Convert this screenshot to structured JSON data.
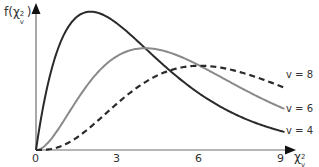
{
  "chart_data": {
    "type": "line",
    "title": "",
    "ylabel": "f(χ²_ν)",
    "xlabel": "χ²_ν",
    "x_ticks": [
      "0",
      "3",
      "6",
      "9"
    ],
    "xlim": [
      0,
      9.3
    ],
    "grid": false,
    "legend_position": "inline-right",
    "series": [
      {
        "name": "ν = 4",
        "label": "v = 4",
        "color": "#2a2a2a",
        "style": "solid",
        "df": 4,
        "x": [
          0,
          1,
          2,
          3,
          4,
          5,
          6,
          7,
          8,
          9
        ],
        "y": [
          0,
          0.152,
          0.184,
          0.167,
          0.135,
          0.103,
          0.075,
          0.053,
          0.037,
          0.025
        ]
      },
      {
        "name": "ν = 6",
        "label": "v = 6",
        "color": "#8a8a8a",
        "style": "solid",
        "df": 6,
        "x": [
          0,
          1,
          2,
          3,
          4,
          5,
          6,
          7,
          8,
          9
        ],
        "y": [
          0,
          0.038,
          0.092,
          0.126,
          0.135,
          0.128,
          0.112,
          0.092,
          0.073,
          0.056
        ]
      },
      {
        "name": "ν = 8",
        "label": "v = 8",
        "color": "#2a2a2a",
        "style": "dashed",
        "df": 8,
        "x": [
          0,
          1,
          2,
          3,
          4,
          5,
          6,
          7,
          8,
          9
        ],
        "y": [
          0,
          0.006,
          0.031,
          0.063,
          0.09,
          0.107,
          0.112,
          0.108,
          0.098,
          0.084
        ]
      }
    ]
  },
  "labels": {
    "y_axis_main": "f(χ",
    "y_axis_sup": "2",
    "y_axis_sub": "v",
    "y_axis_close": ")",
    "x_axis_main": "χ",
    "x_axis_sup": "2",
    "x_axis_sub": "v",
    "tick_0": "0",
    "tick_3": "3",
    "tick_6": "6",
    "tick_9": "9",
    "key_v8": "v = 8",
    "key_v6": "v = 6",
    "key_v4": "v = 4"
  }
}
